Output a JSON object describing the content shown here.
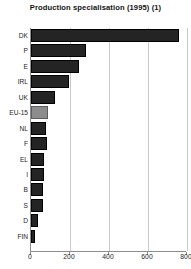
{
  "chart_data": {
    "type": "bar",
    "orientation": "horizontal",
    "title": "Production specialisation (1995) (1)",
    "xlabel": "",
    "ylabel": "",
    "xlim": [
      0,
      800
    ],
    "xticks": [
      0,
      200,
      400,
      600,
      800
    ],
    "xtick_labels": [
      "0",
      "200",
      "400",
      "600",
      "800"
    ],
    "grid": true,
    "grid_axis": "x",
    "legend": null,
    "categories": [
      "DK",
      "P",
      "E",
      "IRL",
      "UK",
      "EU-15",
      "NL",
      "F",
      "EL",
      "I",
      "B",
      "S",
      "D",
      "FIN"
    ],
    "values": [
      760,
      282,
      246,
      195,
      123,
      87,
      77,
      82,
      67,
      67,
      62,
      62,
      36,
      21
    ],
    "highlight_category": "EU-15",
    "colors": {
      "bar": "#242424",
      "bar_border": "#000000",
      "highlight_bar": "#8d8d8d",
      "highlight_border": "#5d5d5d",
      "axis": "#8d8d8d",
      "grid": "#c9c9c9",
      "text": "#1e1e1e",
      "background": "#ffffff"
    }
  }
}
